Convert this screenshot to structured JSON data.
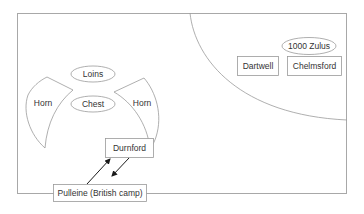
{
  "diagram": {
    "type": "battle-formation",
    "colors": {
      "stroke": "#9a9a9a",
      "frame": "#a8a8a8",
      "text": "#333333",
      "arrow": "#1a1a1a",
      "background": "#ffffff"
    },
    "zulu_formation": {
      "loins": "Loins",
      "chest": "Chest",
      "left_horn": "Horn",
      "right_horn": "Horn"
    },
    "british": {
      "durnford": "Durnford",
      "pulleine": "Pulleine (British camp)"
    },
    "far_area": {
      "zulus": "1000 Zulus",
      "dartwell": "Dartwell",
      "chelmsford": "Chelmsford"
    }
  }
}
